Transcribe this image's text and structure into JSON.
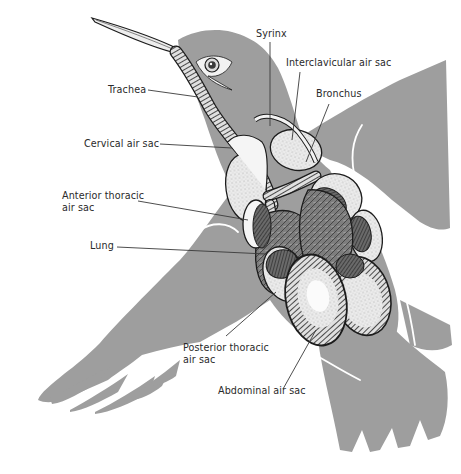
{
  "diagram": {
    "colors": {
      "silhouette": "#9e9e9e",
      "organ_light": "#f2f2f2",
      "organ_mid": "#cfcfcf",
      "organ_dark": "#5a5a5a",
      "outline": "#1c1c1c",
      "leader_line": "#3a3a3a",
      "text": "#2a2a2a"
    },
    "labels": {
      "trachea": "Trachea",
      "syrinx": "Syrinx",
      "interclavicular_air_sac": "Interclavicular air sac",
      "bronchus": "Bronchus",
      "cervical_air_sac": "Cervical air sac",
      "anterior_thoracic_air_sac": {
        "line1": "Anterior thoracic",
        "line2": "air sac"
      },
      "lung": "Lung",
      "posterior_thoracic_air_sac": {
        "line1": "Posterior thoracic",
        "line2": "air sac"
      },
      "abdominal_air_sac": "Abdominal air sac"
    }
  }
}
